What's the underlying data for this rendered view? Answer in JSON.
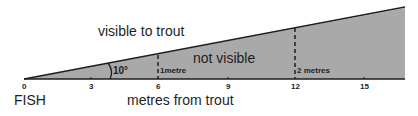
{
  "diagram": {
    "labels": {
      "visible": "visible to trout",
      "not_visible": "not visible",
      "angle": "10°",
      "fish": "FISH",
      "axis_title": "metres from trout",
      "height_1": "1metre",
      "height_2": "2 metres"
    },
    "axis_ticks": [
      "0",
      "3",
      "6",
      "9",
      "12",
      "15"
    ],
    "colors": {
      "wedge_fill": "#a9a9a9",
      "line": "#1e1e1e",
      "background": "#ffffff"
    }
  }
}
